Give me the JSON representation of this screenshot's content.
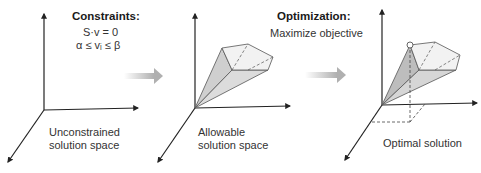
{
  "panels": [
    {
      "id": "unconstrained",
      "caption_line1": "Unconstrained",
      "caption_line2": "solution space"
    },
    {
      "id": "allowable",
      "caption_line1": "Allowable",
      "caption_line2": "solution space"
    },
    {
      "id": "optimal",
      "caption_line1": "Optimal solution"
    }
  ],
  "constraints": {
    "title": "Constraints:",
    "eq1": "S·v = 0",
    "eq2": "α ≤ vᵢ ≤ β"
  },
  "optimization": {
    "title": "Optimization:",
    "subtitle": "Maximize objective"
  },
  "colors": {
    "axis": "#222222",
    "polytope_fill": "#e4e4e4",
    "polytope_dark": "#c8c8c8",
    "polytope_stroke": "#555555",
    "arrow_gray": "#b5b5b5"
  },
  "icons": [
    "axes-3d-icon",
    "polytope-icon",
    "transition-arrow-icon",
    "optimal-point-icon"
  ]
}
